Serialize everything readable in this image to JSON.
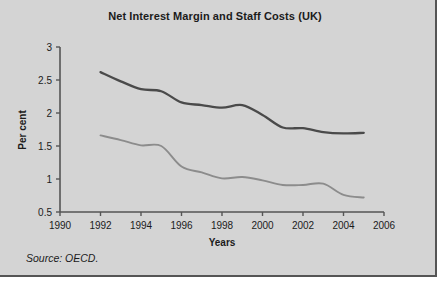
{
  "figure": {
    "background_color": "#d4d4d4",
    "border_color": "#555555"
  },
  "chart_data": {
    "type": "line",
    "title": "Net Interest Margin and Staff Costs (UK)",
    "xlabel": "Years",
    "ylabel": "Per cent",
    "xlim": [
      1990,
      2006
    ],
    "ylim": [
      0.5,
      3
    ],
    "xticks": [
      1990,
      1992,
      1994,
      1996,
      1998,
      2000,
      2002,
      2004,
      2006
    ],
    "xticklabels": [
      "1990",
      "1992",
      "1994",
      "1996",
      "1998",
      "2000",
      "2002",
      "2004",
      "2006"
    ],
    "yticks": [
      0.5,
      1,
      1.5,
      2,
      2.5,
      3
    ],
    "yticklabels": [
      "0.5",
      "1",
      "1.5",
      "2",
      "2.5",
      "3"
    ],
    "grid": false,
    "legend": null,
    "x": [
      1992,
      1993,
      1994,
      1995,
      1996,
      1997,
      1998,
      1999,
      2000,
      2001,
      2002,
      2003,
      2004,
      2005
    ],
    "series": [
      {
        "name": "Net interest margin",
        "color": "#4a4a4a",
        "linewidth": 2.3,
        "values": [
          2.62,
          2.48,
          2.36,
          2.33,
          2.16,
          2.12,
          2.08,
          2.12,
          1.97,
          1.78,
          1.77,
          1.71,
          1.69,
          1.7
        ]
      },
      {
        "name": "Staff costs",
        "color": "#8c8c8c",
        "linewidth": 1.9,
        "values": [
          1.66,
          1.59,
          1.51,
          1.5,
          1.19,
          1.1,
          1.01,
          1.03,
          0.98,
          0.91,
          0.91,
          0.93,
          0.76,
          0.72
        ]
      }
    ]
  },
  "source": {
    "text": "Source: OECD."
  }
}
